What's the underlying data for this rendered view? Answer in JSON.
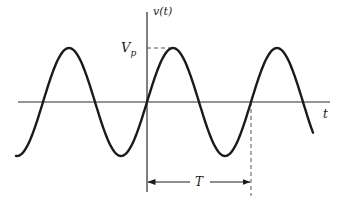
{
  "diagram": {
    "type": "sinusoid-waveform",
    "labels": {
      "y_axis": "v(t)",
      "x_axis": "t",
      "amplitude": "V",
      "amplitude_sub": "p",
      "period": "T"
    },
    "colors": {
      "curve": "#1a1a1a",
      "axes": "#2a2a2a",
      "dashed": "#555555",
      "background": "#ffffff"
    },
    "geometry": {
      "origin_x": 147,
      "axis_y": 102,
      "amplitude_px": 54,
      "period_px": 104,
      "x_start": 16,
      "x_end": 313,
      "t_axis_start": 18,
      "t_axis_end": 330,
      "y_axis_top": 12,
      "y_axis_bottom": 192,
      "period_marker_x": 251,
      "period_arrow_y": 182
    }
  }
}
